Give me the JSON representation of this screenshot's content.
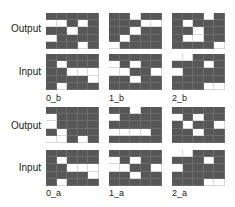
{
  "row_labels": {
    "output": "Output",
    "input": "Input"
  },
  "colors": {
    "dark": "#575757",
    "light": "#ffffff"
  },
  "panels": [
    {
      "label": "0_b",
      "output": [
        [
          0,
          0,
          0,
          0,
          0
        ],
        [
          1,
          1,
          0,
          1,
          0
        ],
        [
          0,
          0,
          1,
          0,
          0
        ],
        [
          1,
          0,
          0,
          0,
          0
        ],
        [
          0,
          0,
          0,
          1,
          0
        ]
      ],
      "input": [
        [
          0,
          0,
          0,
          0,
          0
        ],
        [
          0,
          1,
          0,
          0,
          0
        ],
        [
          0,
          0,
          1,
          1,
          1
        ],
        [
          0,
          0,
          0,
          0,
          1
        ],
        [
          0,
          1,
          0,
          0,
          0
        ]
      ]
    },
    {
      "label": "1_b",
      "output": [
        [
          0,
          0,
          1,
          0,
          0
        ],
        [
          0,
          0,
          0,
          1,
          1
        ],
        [
          0,
          0,
          1,
          0,
          0
        ],
        [
          0,
          1,
          0,
          0,
          0
        ],
        [
          1,
          0,
          0,
          0,
          0
        ]
      ],
      "input": [
        [
          0,
          0,
          0,
          0,
          0
        ],
        [
          1,
          0,
          1,
          0,
          0
        ],
        [
          1,
          1,
          0,
          0,
          1
        ],
        [
          0,
          0,
          1,
          0,
          0
        ],
        [
          0,
          0,
          0,
          0,
          0
        ]
      ]
    },
    {
      "label": "2_b",
      "output": [
        [
          0,
          0,
          0,
          1,
          0
        ],
        [
          0,
          1,
          0,
          0,
          0
        ],
        [
          0,
          0,
          1,
          0,
          0
        ],
        [
          0,
          1,
          1,
          0,
          0
        ],
        [
          0,
          0,
          0,
          0,
          1
        ]
      ],
      "input": [
        [
          1,
          1,
          0,
          0,
          0
        ],
        [
          0,
          0,
          0,
          1,
          0
        ],
        [
          1,
          0,
          0,
          0,
          0
        ],
        [
          0,
          0,
          0,
          0,
          0
        ],
        [
          0,
          0,
          0,
          1,
          1
        ]
      ]
    },
    {
      "label": "0_a",
      "output": [
        [
          0,
          0,
          0,
          0,
          0
        ],
        [
          1,
          0,
          0,
          0,
          0
        ],
        [
          1,
          0,
          0,
          0,
          0
        ],
        [
          0,
          1,
          0,
          0,
          0
        ],
        [
          1,
          1,
          0,
          1,
          0
        ]
      ],
      "input": [
        [
          0,
          0,
          0,
          0,
          0
        ],
        [
          0,
          1,
          0,
          0,
          0
        ],
        [
          0,
          0,
          1,
          1,
          1
        ],
        [
          0,
          0,
          0,
          0,
          1
        ],
        [
          0,
          1,
          0,
          0,
          0
        ]
      ]
    },
    {
      "label": "1_a",
      "output": [
        [
          0,
          0,
          1,
          0,
          0
        ],
        [
          1,
          0,
          0,
          0,
          0
        ],
        [
          0,
          0,
          0,
          0,
          0
        ],
        [
          1,
          1,
          1,
          1,
          0
        ],
        [
          0,
          0,
          0,
          0,
          0
        ]
      ],
      "input": [
        [
          0,
          0,
          0,
          0,
          0
        ],
        [
          1,
          0,
          1,
          0,
          0
        ],
        [
          1,
          1,
          0,
          0,
          1
        ],
        [
          0,
          0,
          1,
          0,
          0
        ],
        [
          0,
          0,
          0,
          0,
          0
        ]
      ]
    },
    {
      "label": "2_a",
      "output": [
        [
          0,
          0,
          0,
          0,
          0
        ],
        [
          1,
          0,
          1,
          0,
          0
        ],
        [
          0,
          1,
          0,
          0,
          1
        ],
        [
          0,
          0,
          1,
          0,
          0
        ],
        [
          0,
          0,
          0,
          0,
          0
        ]
      ],
      "input": [
        [
          1,
          1,
          0,
          0,
          0
        ],
        [
          0,
          0,
          0,
          1,
          0
        ],
        [
          1,
          0,
          0,
          0,
          0
        ],
        [
          0,
          0,
          0,
          0,
          0
        ],
        [
          0,
          0,
          0,
          1,
          1
        ]
      ]
    }
  ]
}
